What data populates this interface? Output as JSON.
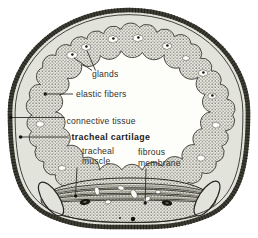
{
  "labels": {
    "glands": "glands",
    "elastic_fibers": "elastic fibers",
    "connective_tissue": "connective tissue",
    "tracheal_cartilage": "tracheal cartilage",
    "tracheal_muscle_line1": "tracheal",
    "tracheal_muscle_line2": "muscle",
    "fibrous_membrane_line1": "fibrous",
    "fibrous_membrane_line2": "membrane"
  },
  "colors": {
    "background": "#ffffff",
    "cartilage_band": "#e2e3db",
    "lumen": "#fdfdfa",
    "stipple_bg": "#eaeae2",
    "stipple_dot": "#4f4e45",
    "rim": "#3e3d34",
    "outline": "#26251f",
    "leader": "#2c2b26",
    "text": "#32312c",
    "text_bold": "#1d1c18",
    "vessel": "#16150e",
    "gland_fill": "#fcfcf9"
  }
}
